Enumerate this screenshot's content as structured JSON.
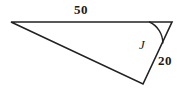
{
  "figure": {
    "type": "triangle-diagram",
    "background_color": "#ffffff",
    "stroke_color": "#222222",
    "text_color": "#1a1a1a",
    "width": 177,
    "height": 99,
    "vertices": {
      "left": {
        "x": 11,
        "y": 22
      },
      "top_right": {
        "x": 172,
        "y": 22
      },
      "bottom": {
        "x": 143,
        "y": 84
      }
    },
    "sides": [
      {
        "name": "top-side",
        "from": "left",
        "to": "top_right",
        "label": "50"
      },
      {
        "name": "right-side",
        "from": "top_right",
        "to": "bottom",
        "label": "20"
      },
      {
        "name": "hypotenuse",
        "from": "left",
        "to": "bottom",
        "label": ""
      }
    ],
    "angle_arc": {
      "at_vertex": "top_right",
      "label": "J",
      "radius": 23
    },
    "labels": {
      "top_side": "50",
      "right_side": "20",
      "angle": "J"
    }
  }
}
